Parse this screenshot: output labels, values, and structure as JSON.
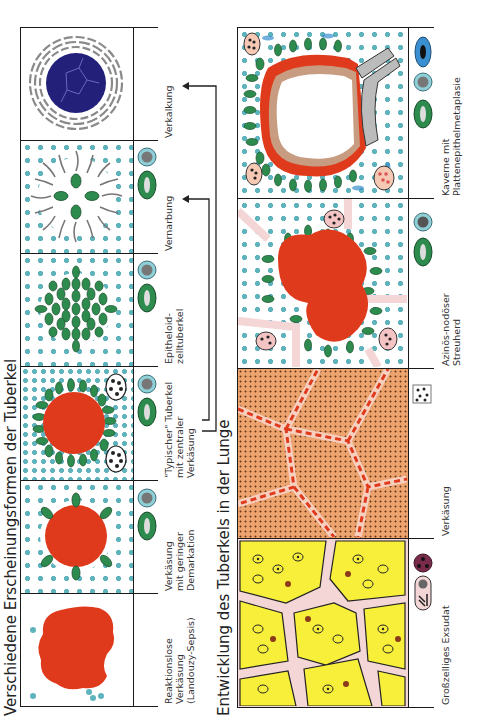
{
  "figure": {
    "orientation": "rotated-90-ccw",
    "top_section": {
      "title": "Verschiedene Erscheinungsformen der Tuberkel",
      "panels": [
        {
          "id": "reaktionslos",
          "label_lines": [
            "Reaktionslose",
            "Verkäsung",
            "(Landouzy-Sepsis)"
          ],
          "legend_icons": []
        },
        {
          "id": "geringe-demarkation",
          "label_lines": [
            "Verkäsung",
            "mit geringer",
            "Demarkation"
          ],
          "legend_icons": [
            "lymphocyte",
            "epithelioid-cell"
          ]
        },
        {
          "id": "typischer-tuberkel",
          "label_lines": [
            "\"Typischer\" Tuberkel",
            "mit zentraler",
            "Verkäsung"
          ],
          "legend_icons": [
            "lymphocyte",
            "epithelioid-cell"
          ]
        },
        {
          "id": "epitheloidzelltuberkel",
          "label_lines": [
            "Epitheloid-",
            "zelltuberkel"
          ],
          "legend_icons": [
            "lymphocyte",
            "epithelioid-cell"
          ]
        },
        {
          "id": "vernarbung",
          "label_lines": [
            "Vernarbung"
          ],
          "legend_icons": [
            "lymphocyte",
            "epithelioid-cell"
          ]
        },
        {
          "id": "verkalkung",
          "label_lines": [
            "Verkalkung"
          ],
          "legend_icons": []
        }
      ],
      "arrows": [
        {
          "from": "typischer-tuberkel",
          "to": "vernarbung"
        },
        {
          "from": "typischer-tuberkel",
          "to": "verkalkung"
        }
      ]
    },
    "bottom_section": {
      "title": "Entwicklung des Tuberkels in der Lunge",
      "panels": [
        {
          "id": "exsudat",
          "label_lines": [
            "Großzelliges Exsudat"
          ],
          "legend_icons": [
            "macrophage",
            "granulocyte"
          ]
        },
        {
          "id": "verkaesung",
          "label_lines": [
            "Verkäsung"
          ],
          "legend_icons": [
            "caseous-texture"
          ]
        },
        {
          "id": "streuherd",
          "label_lines": [
            "Azinös-nodöser",
            "Streuherd"
          ],
          "legend_icons": [
            "lymphocyte",
            "epithelioid-cell"
          ]
        },
        {
          "id": "kaverne",
          "label_lines": [
            "Kaverne mit",
            "Plattenepithelmetaplasie"
          ],
          "legend_icons": [
            "squamous-cell",
            "lymphocyte",
            "epithelioid-cell"
          ]
        }
      ]
    },
    "colors": {
      "caseation_red": "#e03a1c",
      "lymphocyte_teal": "#5fb3bd",
      "epithelioid_green": "#2e8b4e",
      "calcification_navy": "#23207a",
      "exudate_yellow": "#f7ef3a",
      "septum_pink": "#f4d6d6",
      "caseous_orange": "#eda36e",
      "squamous_blue": "#3a8fd0"
    }
  }
}
